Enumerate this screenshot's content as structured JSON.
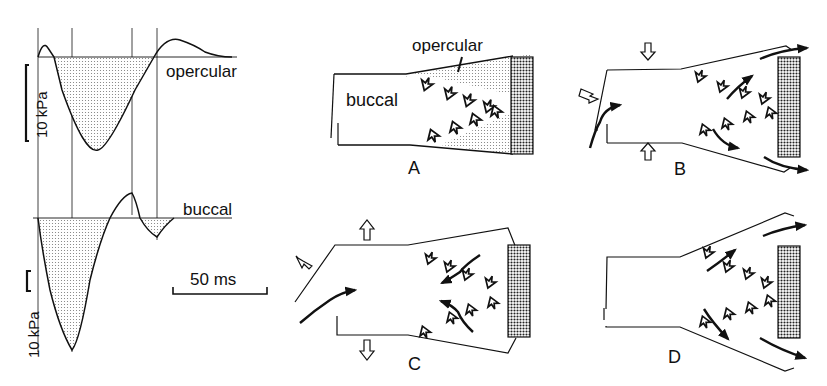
{
  "traces": {
    "opercular_label": "opercular",
    "buccal_label": "buccal",
    "scale_upper": "10 kPa",
    "scale_lower": "10 kPa",
    "time_scale": "50 ms"
  },
  "panels": {
    "A": {
      "label": "A",
      "buccal_label": "buccal",
      "opercular_label": "opercular"
    },
    "B": {
      "label": "B"
    },
    "C": {
      "label": "C"
    },
    "D": {
      "label": "D"
    }
  },
  "colors": {
    "ink": "#111111",
    "stipple": "#bdbdbd",
    "background": "#ffffff"
  }
}
